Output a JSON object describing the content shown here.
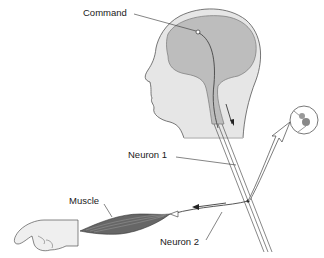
{
  "diagram": {
    "type": "motor-pathway-illustration",
    "labels": {
      "command": "Command",
      "neuron1": "Neuron 1",
      "neuron2": "Neuron 2",
      "muscle": "Muscle"
    },
    "elements": [
      "head-with-brain",
      "spinal-cord",
      "neuron-1",
      "neuron-2",
      "synapse-inset",
      "muscle",
      "hand"
    ],
    "colors": {
      "skin": "#e4e4e4",
      "brain": "#bdbdbd",
      "outline": "#555555",
      "line": "#333333"
    }
  }
}
